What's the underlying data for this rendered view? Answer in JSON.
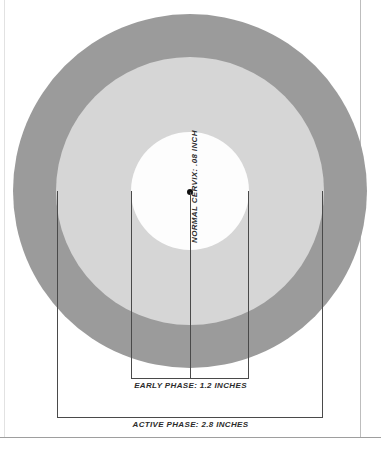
{
  "figure": {
    "background_color": "#ffffff"
  },
  "chart_data": {
    "type": "pie",
    "subtype": "concentric-circle scale diagram",
    "unit": "inches",
    "categories": [
      "Normal cervix",
      "Early phase",
      "Active phase"
    ],
    "values": [
      0.08,
      1.2,
      2.8
    ],
    "labels": [
      "NORMAL CERVIX: .08 INCH",
      "EARLY PHASE: 1.2 INCHES",
      "ACTIVE PHASE: 2.8 INCHES"
    ],
    "colors": [
      "#fdfdfd",
      "#d6d6d6",
      "#9b9b9b"
    ],
    "grid": false,
    "legend": "none",
    "annotations": [
      "NORMAL CERVIX: .08 INCH",
      "EARLY PHASE: 1.2 INCHES",
      "ACTIVE PHASE: 2.8 INCHES"
    ]
  },
  "rings": {
    "outer": {
      "name": "active-phase-circle",
      "label": "ACTIVE PHASE: 2.8 INCHES",
      "value": 2.8,
      "color": "#9b9b9b"
    },
    "middle": {
      "name": "early-phase-circle",
      "label": "EARLY PHASE: 1.2 INCHES",
      "value": 1.2,
      "color": "#d6d6d6"
    },
    "inner": {
      "name": "normal-cervix-circle",
      "label": "NORMAL CERVIX: .08 INCH",
      "value": 0.08,
      "color": "#fdfdfd"
    }
  },
  "captions": {
    "normal_cervix": "NORMAL CERVIX: .08 INCH",
    "early_phase": "EARLY PHASE: 1.2 INCHES",
    "active_phase": "ACTIVE PHASE: 2.8 INCHES"
  },
  "markers": {
    "center_point": "center-dot",
    "center_point_color": "#101010"
  }
}
